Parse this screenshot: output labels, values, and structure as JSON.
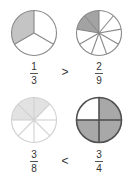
{
  "comparisons": [
    {
      "left": {
        "numerator": "1",
        "denominator": "3",
        "parts": 3,
        "shaded": 1,
        "fill": "#c4c4c4",
        "stroke": "#888888",
        "start_angle": 0,
        "direction": "ccw"
      },
      "operator": ">",
      "right": {
        "numerator": "2",
        "denominator": "9",
        "parts": 9,
        "shaded": 2,
        "fill": "#a3a3a3",
        "stroke": "#888888",
        "start_angle": 0,
        "direction": "ccw"
      }
    },
    {
      "left": {
        "numerator": "3",
        "denominator": "8",
        "parts": 8,
        "shaded": 3,
        "fill": "#e2e2e2",
        "stroke": "#d0d0d0",
        "start_angle": -90,
        "direction": "cw"
      },
      "operator": "<",
      "right": {
        "numerator": "3",
        "denominator": "4",
        "parts": 4,
        "shaded": 3,
        "fill": "#a8a8a8",
        "stroke": "#505050",
        "start_angle": 0,
        "direction": "cw"
      }
    }
  ]
}
